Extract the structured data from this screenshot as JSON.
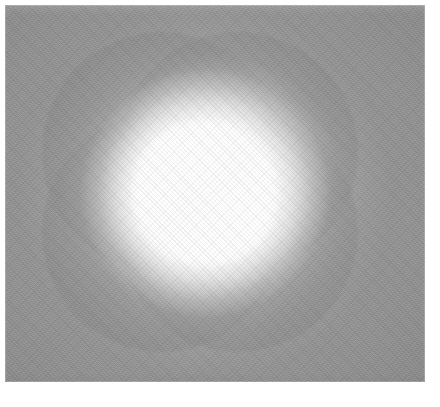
{
  "image": {
    "title": "Rosette Glow",
    "alt_text": "Abstract grayscale rendering: four overlapping translucent discs forming a quatrefoil rosette behind a bright white glowing central sphere",
    "width_px": 440,
    "height_px": 407,
    "page_margin_px": 5,
    "field": {
      "left_px": 5,
      "top_px": 5,
      "width_px": 420,
      "height_px": 377,
      "background_color": "#969696",
      "page_color": "#ffffff"
    },
    "palette": {
      "page_white": "#ffffff",
      "field_gray": "#969696",
      "disc_gray": "#7e7e7e",
      "overlap_dark_gray": "#767676",
      "core_white": "#ffffff",
      "vignette_shadow": "#000000"
    },
    "composition": {
      "center_x_px": 205,
      "center_y_px": 193,
      "pattern": "quatrefoil-rosette",
      "disc_count": 4,
      "disc_radius_px": 120,
      "disc_opacity": 0.3,
      "core_radius_px": 76,
      "halo_radius_px": 230,
      "texture": "diagonal-crosshatch-grain",
      "vignette": "corner-darkening"
    },
    "discs": [
      {
        "id": "top-left",
        "center_x_px": 162,
        "center_y_px": 152,
        "radius_px": 120
      },
      {
        "id": "top-right",
        "center_x_px": 238,
        "center_y_px": 152,
        "radius_px": 120
      },
      {
        "id": "bottom-left",
        "center_x_px": 162,
        "center_y_px": 232,
        "radius_px": 120
      },
      {
        "id": "bottom-right",
        "center_x_px": 238,
        "center_y_px": 232,
        "radius_px": 120
      }
    ]
  }
}
